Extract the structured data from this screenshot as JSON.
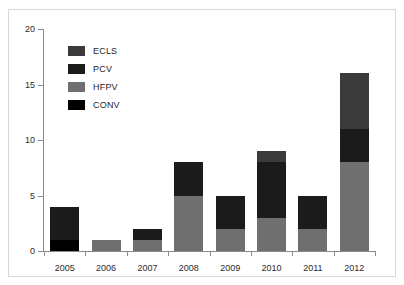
{
  "caption_sliver": "",
  "axis": {
    "y_ticks": [
      0,
      5,
      10,
      15,
      20
    ],
    "y_min": 0,
    "y_max": 20,
    "ylabel": "",
    "xlabel": ""
  },
  "legend": {
    "position": "top-left-inside",
    "items": [
      {
        "label": "ECLS",
        "color": "#3b3b3b"
      },
      {
        "label": "PCV",
        "color": "#1b1b1b"
      },
      {
        "label": "HFPV",
        "color": "#6f6f6f"
      },
      {
        "label": "CONV",
        "color": "#000000"
      }
    ]
  },
  "colors": {
    "ECLS": "#3b3b3b",
    "PCV": "#1b1b1b",
    "HFPV": "#6f6f6f",
    "CONV": "#000000",
    "axis": "#8a8a8a",
    "frame": "#d7d7d7",
    "background": "#ffffff",
    "text": "#2b2b2b"
  },
  "chart_data": {
    "type": "bar",
    "subtype": "stacked",
    "title": "",
    "subtitle": "",
    "xlabel": "",
    "ylabel": "",
    "ylim": [
      0,
      20
    ],
    "yticks": [
      0,
      5,
      10,
      15,
      20
    ],
    "grid": false,
    "legend_position": "top-left-inside",
    "categories": [
      "2005",
      "2006",
      "2007",
      "2008",
      "2009",
      "2010",
      "2011",
      "2012"
    ],
    "series": [
      {
        "name": "CONV",
        "color": "#000000",
        "values": [
          1,
          0,
          0,
          0,
          0,
          0,
          0,
          0
        ]
      },
      {
        "name": "HFPV",
        "color": "#6f6f6f",
        "values": [
          0,
          1,
          1,
          5,
          2,
          3,
          2,
          8
        ]
      },
      {
        "name": "PCV",
        "color": "#1b1b1b",
        "values": [
          3,
          0,
          1,
          3,
          3,
          5,
          3,
          3
        ]
      },
      {
        "name": "ECLS",
        "color": "#3b3b3b",
        "values": [
          0,
          0,
          0,
          0,
          0,
          1,
          0,
          5
        ]
      }
    ],
    "stack_order_bottom_to_top": [
      "CONV",
      "HFPV",
      "PCV",
      "ECLS"
    ],
    "totals": [
      4,
      1,
      2,
      8,
      5,
      9,
      5,
      16
    ]
  }
}
